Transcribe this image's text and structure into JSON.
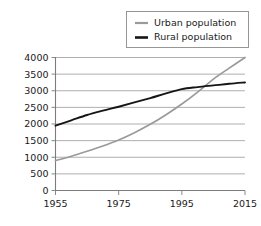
{
  "chart_data": {
    "type": "line",
    "title": "",
    "subtitle": "",
    "xlabel": "",
    "ylabel": "",
    "xlim": [
      1955,
      2015
    ],
    "ylim": [
      0,
      4000
    ],
    "grid": "horizontal",
    "legend_position": "top-right",
    "x_ticks": [
      "1955",
      "1975",
      "1995",
      "2015"
    ],
    "x_tick_values": [
      1955,
      1975,
      1995,
      2015
    ],
    "y_ticks": [
      "0",
      "500",
      "1000",
      "1500",
      "2000",
      "2500",
      "3000",
      "3500",
      "4000"
    ],
    "y_tick_values": [
      0,
      500,
      1000,
      1500,
      2000,
      2500,
      3000,
      3500,
      4000
    ],
    "x": [
      1955,
      1960,
      1965,
      1970,
      1975,
      1980,
      1985,
      1990,
      1995,
      2000,
      2005,
      2010,
      2015
    ],
    "series": [
      {
        "name": "Urban population",
        "color": "#9a9a9a",
        "width": 1.7,
        "values": [
          900,
          1030,
          1180,
          1340,
          1520,
          1740,
          1990,
          2280,
          2600,
          2960,
          3350,
          3680,
          4000
        ]
      },
      {
        "name": "Rural population",
        "color": "#151515",
        "width": 1.9,
        "values": [
          1950,
          2110,
          2270,
          2400,
          2520,
          2650,
          2780,
          2920,
          3050,
          3110,
          3160,
          3210,
          3250
        ]
      }
    ],
    "annotations": [
      {
        "text": "crossover",
        "x": 2002,
        "y": 3120
      }
    ]
  },
  "legend": {
    "items": [
      {
        "label": "Urban population",
        "color": "#9a9a9a"
      },
      {
        "label": "Rural population",
        "color": "#151515"
      }
    ]
  },
  "axes": {
    "x_tick_labels": [
      "1955",
      "1975",
      "1995",
      "2015"
    ],
    "y_tick_labels": [
      "0",
      "500",
      "1000",
      "1500",
      "2000",
      "2500",
      "3000",
      "3500",
      "4000"
    ]
  }
}
